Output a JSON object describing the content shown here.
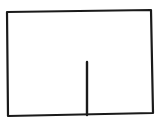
{
  "sketch": {
    "description": "Hand-drawn rectangle with a vertical line rising from the bottom edge",
    "background": "#ffffff",
    "stroke_color": "#1a1a1a",
    "stroke_width": 2.2,
    "rectangle": {
      "top_left": [
        7,
        12
      ],
      "top_right": [
        151,
        10
      ],
      "bottom_right": [
        153,
        113
      ],
      "bottom_left": [
        8,
        116
      ]
    },
    "vertical_line": {
      "start": [
        87,
        62
      ],
      "end": [
        87,
        115
      ]
    }
  }
}
